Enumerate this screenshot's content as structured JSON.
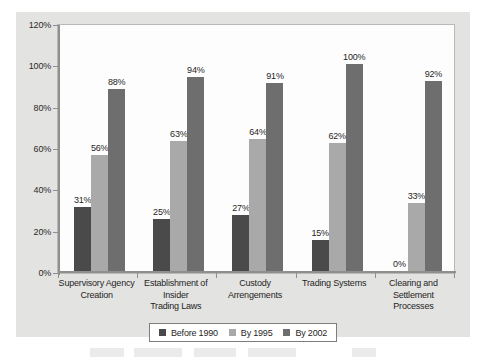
{
  "chart_data": {
    "type": "bar",
    "title": "",
    "xlabel": "",
    "ylabel": "",
    "ylim": [
      0,
      120
    ],
    "grid": false,
    "legend_position": "bottom",
    "y_ticks": [
      "0%",
      "20%",
      "40%",
      "60%",
      "80%",
      "100%",
      "120%"
    ],
    "y_tick_values": [
      0,
      20,
      40,
      60,
      80,
      100,
      120
    ],
    "categories": [
      "Supervisory Agency Creation",
      "Establishment of Insider Trading Laws",
      "Custody Arrengements",
      "Trading Systems",
      "Clearing and Settlement Processes"
    ],
    "category_lines": [
      [
        "Supervisory Agency",
        "Creation"
      ],
      [
        "Establishment of",
        "Insider",
        "Trading Laws"
      ],
      [
        "Custody",
        "Arrengements"
      ],
      [
        "Trading Systems"
      ],
      [
        "Clearing and",
        "Settlement",
        "Processes"
      ]
    ],
    "series": [
      {
        "name": "Before 1990",
        "color": "#4a4a4a",
        "values": [
          31,
          25,
          27,
          15,
          0
        ],
        "labels": [
          "31%",
          "25%",
          "27%",
          "15%",
          "0%"
        ]
      },
      {
        "name": "By 1995",
        "color": "#a9a9a9",
        "values": [
          56,
          63,
          64,
          62,
          33
        ],
        "labels": [
          "56%",
          "63%",
          "64%",
          "62%",
          "33%"
        ]
      },
      {
        "name": "By 2002",
        "color": "#6e6e6e",
        "values": [
          88,
          94,
          91,
          100,
          92
        ],
        "labels": [
          "88%",
          "94%",
          "91%",
          "100%",
          "92%"
        ]
      }
    ]
  },
  "colors": {
    "panel_background": "#e3e3e1",
    "plot_background": "#fdfdfd",
    "axis": "#8f8f8d",
    "text": "#1f1f1f"
  }
}
